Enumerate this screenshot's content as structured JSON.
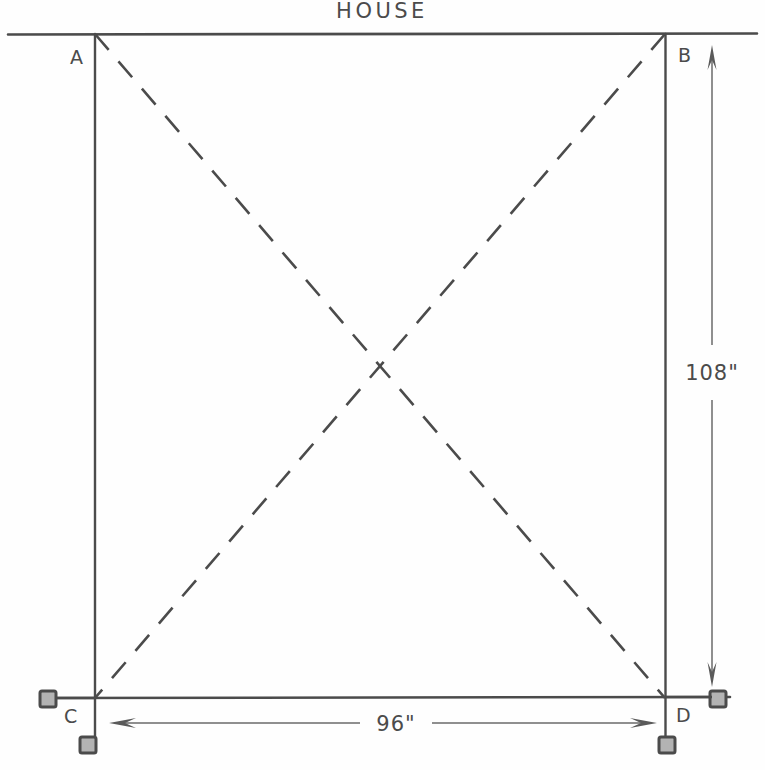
{
  "drawing": {
    "title": "HOUSE",
    "units_note": "inches",
    "labels": {
      "corner_a": "A",
      "corner_b": "B",
      "corner_c": "C",
      "corner_d": "D"
    },
    "dimensions": {
      "vertical": "108\"",
      "horizontal": "96\""
    },
    "colors": {
      "ink": "#4b4b4b",
      "ink_light": "#6a6a6a",
      "paper": "#fefefe",
      "anchor_fill": "#b0b0b0",
      "anchor_border": "#4b4b4b"
    },
    "geometry": {
      "house_line": {
        "x1": 8,
        "y1": 34,
        "x2": 757,
        "y2": 34
      },
      "post_left": {
        "x": 95,
        "y_top": 34,
        "y_bottom": 745
      },
      "post_right": {
        "x": 665,
        "y_top": 34,
        "y_bottom": 745
      },
      "sill_line": {
        "x1": 45,
        "y1": 698,
        "x2": 730,
        "y2": 698
      },
      "brace_ad": {
        "x1": 95,
        "y1": 34,
        "x2": 665,
        "y2": 698
      },
      "brace_bc": {
        "x1": 665,
        "y1": 34,
        "x2": 95,
        "y2": 698
      },
      "dim_vertical_x": 712,
      "dim_vertical_top": 48,
      "dim_vertical_bottom": 685,
      "dim_horizontal_y": 723,
      "dim_horizontal_left": 110,
      "dim_horizontal_right": 655
    },
    "anchors": [
      {
        "name": "anchor-c-left",
        "x": 40,
        "y": 691
      },
      {
        "name": "anchor-c-bottom",
        "x": 80,
        "y": 738
      },
      {
        "name": "anchor-d-right",
        "x": 710,
        "y": 691
      },
      {
        "name": "anchor-d-bottom",
        "x": 660,
        "y": 738
      }
    ]
  }
}
